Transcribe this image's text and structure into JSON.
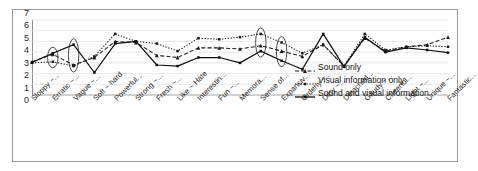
{
  "chart_data": {
    "type": "line",
    "title": "",
    "xlabel": "",
    "ylabel": "",
    "ylim": [
      0,
      7
    ],
    "yticks": [
      0,
      1,
      2,
      3,
      4,
      5,
      6,
      7
    ],
    "grid": true,
    "legend_position": "inside-right",
    "categories": [
      "Sloppy ~...",
      "Erratic ~...",
      "Vague ~...",
      "Soft ~ hard",
      "Powerful...",
      "Strong ~...",
      "Fresh ~...",
      "Like ~ Hate",
      "Interestin...",
      "Fun ~...",
      "Memora...",
      "Sense of...",
      "Expansiv...",
      "Orderly ~...",
      "Dirty ~...",
      "Detached...",
      "Gaudy ~...",
      "Cheerful...",
      "Light ~...",
      "Unique ~...",
      "Fantastic..."
    ],
    "series": [
      {
        "name": "Sound only",
        "style": "dashed",
        "marker": "triangle",
        "color": "#1a1a1a",
        "values": [
          3.1,
          3.8,
          2.8,
          3.5,
          5.0,
          4.9,
          3.7,
          3.5,
          4.4,
          4.4,
          4.3,
          4.6,
          4.1,
          3.6,
          4.7,
          2.7,
          5.3,
          4.1,
          4.5,
          4.7,
          5.4
        ]
      },
      {
        "name": "Visual information only",
        "style": "dotted",
        "marker": "square",
        "color": "#1a1a1a",
        "values": [
          3.0,
          3.1,
          2.7,
          3.6,
          5.7,
          5.0,
          4.8,
          4.1,
          5.3,
          5.2,
          5.4,
          5.7,
          4.9,
          3.9,
          4.7,
          2.7,
          5.7,
          4.2,
          4.5,
          4.6,
          4.5
        ]
      },
      {
        "name": "Sound and visual information",
        "style": "solid",
        "marker": "square",
        "color": "#101010",
        "values": [
          3.05,
          3.9,
          4.7,
          2.1,
          4.8,
          5.0,
          2.8,
          2.7,
          3.5,
          3.5,
          3.0,
          4.1,
          3.2,
          2.4,
          5.7,
          2.65,
          5.4,
          4.0,
          4.4,
          4.2,
          3.95
        ]
      }
    ],
    "annotations": {
      "type": "ellipse-highlight",
      "category_indices": [
        1,
        2,
        11,
        12
      ],
      "labels": [
        "Erratic ~...",
        "Vague ~...",
        "Sense of...",
        "Expansiv..."
      ]
    }
  }
}
